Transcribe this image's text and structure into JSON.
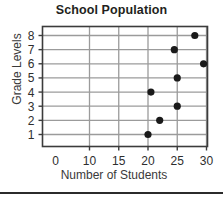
{
  "chart_data": {
    "type": "scatter",
    "title": "School Population",
    "xlabel": "Number of Students",
    "ylabel": "Grade Levels",
    "x_ticks": [
      0,
      10,
      15,
      20,
      25,
      30
    ],
    "x_tick_labels": [
      "0",
      "10",
      "15",
      "20",
      "25",
      "30"
    ],
    "y_ticks": [
      1,
      2,
      3,
      4,
      5,
      6,
      7,
      8
    ],
    "y_tick_labels": [
      "1",
      "2",
      "3",
      "4",
      "5",
      "6",
      "7",
      "8"
    ],
    "xlim": [
      0,
      33
    ],
    "ylim": [
      0.3,
      8.8
    ],
    "grid": true,
    "legend": false,
    "marker_color": "#1a1a1a",
    "grid_color": "#9b9b9b",
    "frame_color": "#3c3c3c",
    "points": [
      {
        "grade": 1,
        "students": 20
      },
      {
        "grade": 2,
        "students": 22
      },
      {
        "grade": 3,
        "students": 25
      },
      {
        "grade": 4,
        "students": 20.5
      },
      {
        "grade": 5,
        "students": 25
      },
      {
        "grade": 6,
        "students": 29.5
      },
      {
        "grade": 7,
        "students": 24.5
      },
      {
        "grade": 8,
        "students": 28
      }
    ]
  }
}
